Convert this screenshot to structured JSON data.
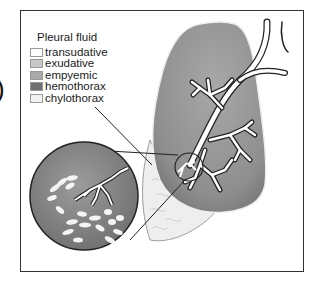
{
  "figure": {
    "partial_label": ")",
    "legend": {
      "title": "Pleural fluid",
      "items": [
        {
          "label": "transudative",
          "color": "#ffffff"
        },
        {
          "label": "exudative",
          "color": "#c8c8c8"
        },
        {
          "label": "empyemic",
          "color": "#a9a9a9"
        },
        {
          "label": "hemothorax",
          "color": "#707070"
        },
        {
          "label": "chylothorax",
          "color": "#f2f2f2"
        }
      ]
    },
    "colors": {
      "lung": "#9a9a9a",
      "lung_dark": "#6e6e6e",
      "effusion": "#eeeeee",
      "airway": "#ffffff",
      "outline": "#333333"
    }
  }
}
